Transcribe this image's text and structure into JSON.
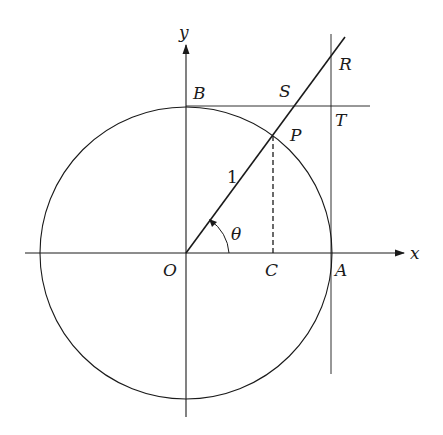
{
  "diagram": {
    "title": "",
    "axes": {
      "x_label": "x",
      "y_label": "y"
    },
    "points": {
      "O": "O",
      "A": "A",
      "B": "B",
      "C": "C",
      "P": "P",
      "S": "S",
      "T": "T",
      "R": "R"
    },
    "radius_label": "1",
    "angle_label": "θ",
    "colors": {
      "stroke": "#1a1a1a",
      "background": "#ffffff"
    }
  }
}
